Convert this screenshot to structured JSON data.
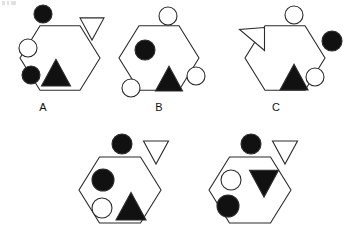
{
  "figure": {
    "type": "visual-analogy-puzzle",
    "background_color": "#ffffff",
    "stroke_color": "#2b2b2b",
    "fill_black": "#111111",
    "fill_white": "#ffffff",
    "stroke_width": 1.1,
    "answer_options": [
      {
        "id": "A",
        "label": "A",
        "hexagon": {
          "cx": 60,
          "cy": 58,
          "r": 40
        },
        "elements": [
          {
            "name": "black-circle-top",
            "shape": "circle",
            "fill": "black",
            "cx": 43,
            "cy": 14,
            "r": 9
          },
          {
            "name": "white-triangle-right",
            "shape": "triangle",
            "orientation": "down",
            "fill": "white",
            "cx": 92,
            "cy": 40,
            "size": 24
          },
          {
            "name": "white-circle-upper-left",
            "shape": "circle",
            "fill": "white",
            "cx": 28,
            "cy": 48,
            "r": 9
          },
          {
            "name": "black-circle-lower-left",
            "shape": "circle",
            "fill": "black",
            "cx": 31,
            "cy": 75,
            "r": 9
          },
          {
            "name": "black-triangle-bottom",
            "shape": "triangle",
            "orientation": "up",
            "fill": "black",
            "cx": 56,
            "cy": 86,
            "size": 29
          }
        ]
      },
      {
        "id": "B",
        "label": "B",
        "hexagon": {
          "cx": 159,
          "cy": 58,
          "r": 40
        },
        "elements": [
          {
            "name": "white-circle-top",
            "shape": "circle",
            "fill": "white",
            "cx": 168,
            "cy": 16,
            "r": 9
          },
          {
            "name": "black-circle-upper-left",
            "shape": "circle",
            "fill": "black",
            "cx": 145,
            "cy": 50,
            "r": 10
          },
          {
            "name": "white-circle-right",
            "shape": "circle",
            "fill": "white",
            "cx": 196,
            "cy": 76,
            "r": 9
          },
          {
            "name": "white-circle-lower-left",
            "shape": "circle",
            "fill": "white",
            "cx": 131,
            "cy": 88,
            "r": 9
          },
          {
            "name": "black-triangle-bottom",
            "shape": "triangle",
            "orientation": "up",
            "fill": "black",
            "cx": 169,
            "cy": 91,
            "size": 27
          }
        ]
      },
      {
        "id": "C",
        "label": "C",
        "hexagon": {
          "cx": 285,
          "cy": 58,
          "r": 40
        },
        "elements": [
          {
            "name": "white-circle-top",
            "shape": "circle",
            "fill": "white",
            "cx": 294,
            "cy": 15,
            "r": 9
          },
          {
            "name": "white-triangle-upper-left",
            "shape": "triangle",
            "orientation": "left",
            "fill": "white",
            "cx": 252,
            "cy": 39,
            "size": 25
          },
          {
            "name": "black-circle-right",
            "shape": "circle",
            "fill": "black",
            "cx": 332,
            "cy": 41,
            "r": 10
          },
          {
            "name": "white-circle-inner-right",
            "shape": "circle",
            "fill": "white",
            "cx": 315,
            "cy": 77,
            "r": 9
          },
          {
            "name": "black-triangle-bottom",
            "shape": "triangle",
            "orientation": "up",
            "fill": "black",
            "cx": 294,
            "cy": 90,
            "size": 28
          }
        ]
      }
    ],
    "problem_row": [
      {
        "id": "D",
        "label": "",
        "hexagon": {
          "cx": 120,
          "cy": 190,
          "r": 41
        },
        "elements": [
          {
            "name": "black-circle-top",
            "shape": "circle",
            "fill": "black",
            "cx": 122,
            "cy": 144,
            "r": 10
          },
          {
            "name": "white-triangle-right",
            "shape": "triangle",
            "orientation": "down",
            "fill": "white",
            "cx": 156,
            "cy": 164,
            "size": 25
          },
          {
            "name": "black-circle-upper-left",
            "shape": "circle",
            "fill": "black",
            "cx": 103,
            "cy": 180,
            "r": 11
          },
          {
            "name": "white-circle-lower-left",
            "shape": "circle",
            "fill": "white",
            "cx": 102,
            "cy": 208,
            "r": 10
          },
          {
            "name": "black-triangle-bottom",
            "shape": "triangle",
            "orientation": "up",
            "fill": "black",
            "cx": 131,
            "cy": 220,
            "size": 30
          }
        ]
      },
      {
        "id": "E",
        "label": "",
        "hexagon": {
          "cx": 250,
          "cy": 190,
          "r": 41
        },
        "elements": [
          {
            "name": "black-circle-top",
            "shape": "circle",
            "fill": "black",
            "cx": 251,
            "cy": 144,
            "r": 10
          },
          {
            "name": "white-triangle-right",
            "shape": "triangle",
            "orientation": "down",
            "fill": "white",
            "cx": 285,
            "cy": 164,
            "size": 25
          },
          {
            "name": "white-circle-upper-left",
            "shape": "circle",
            "fill": "white",
            "cx": 231,
            "cy": 180,
            "r": 10
          },
          {
            "name": "black-circle-lower-left",
            "shape": "circle",
            "fill": "black",
            "cx": 228,
            "cy": 206,
            "r": 11
          },
          {
            "name": "black-triangle-inverted-center",
            "shape": "triangle",
            "orientation": "down",
            "fill": "black",
            "cx": 264,
            "cy": 197,
            "size": 29
          }
        ]
      }
    ]
  }
}
